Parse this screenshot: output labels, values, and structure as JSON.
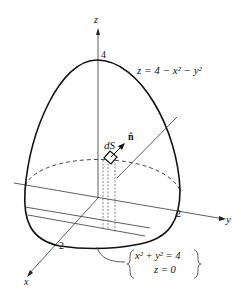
{
  "figure": {
    "axis_labels": {
      "z": "z",
      "y": "y",
      "x": "x"
    },
    "ticks": {
      "z": "4",
      "y": "2",
      "x": "2"
    },
    "surface_equation": "z = 4 − x² − y²",
    "dS_label": "dS",
    "normal_label": "n̂",
    "boundary_eq_line1": "x² + y² = 4",
    "boundary_eq_line2": "z = 0"
  }
}
